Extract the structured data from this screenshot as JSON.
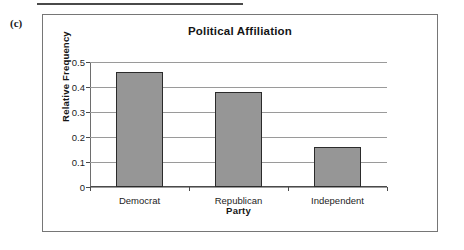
{
  "page": {
    "part_label": "(c)",
    "top_rule": "horizontal-rule"
  },
  "chart_data": {
    "type": "bar",
    "title": "Political Affiliation",
    "xlabel": "Party",
    "ylabel": "Relative Frequency",
    "categories": [
      "Democrat",
      "Republican",
      "Independent"
    ],
    "values": [
      0.46,
      0.38,
      0.16
    ],
    "ylim": [
      0,
      0.5
    ],
    "yticks": [
      0,
      0.1,
      0.2,
      0.3,
      0.4,
      0.5
    ],
    "ytick_labels": [
      "0",
      "0.1",
      "0.2",
      "0.3",
      "0.4",
      "0.5"
    ],
    "grid": true,
    "legend": false,
    "bar_fill_color": "#969696",
    "bar_border_color": "#2b2b2b",
    "gridline_color": "#9a9a9a",
    "axis_color": "#4a4a4a",
    "background_color": "#ffffff"
  }
}
